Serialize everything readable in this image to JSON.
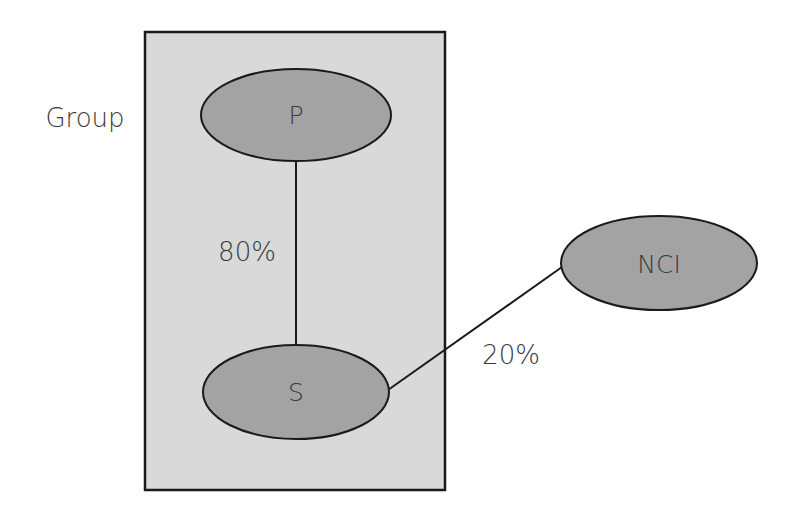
{
  "diagram": {
    "type": "ownership-structure",
    "colors": {
      "background": "#ffffff",
      "group_box_fill": "#d9d9d9",
      "group_box_stroke": "#1a1a1a",
      "node_fill": "#a3a3a3",
      "node_stroke": "#1a1a1a",
      "edge_stroke": "#1a1a1a",
      "text": "#3a3a3a"
    },
    "group": {
      "label": "Group"
    },
    "nodes": [
      {
        "id": "P",
        "label": "P"
      },
      {
        "id": "S",
        "label": "S"
      },
      {
        "id": "NCI",
        "label": "NCI"
      }
    ],
    "edges": [
      {
        "from": "P",
        "to": "S",
        "label": "80%"
      },
      {
        "from": "S",
        "to": "NCI",
        "label": "20%"
      }
    ]
  }
}
